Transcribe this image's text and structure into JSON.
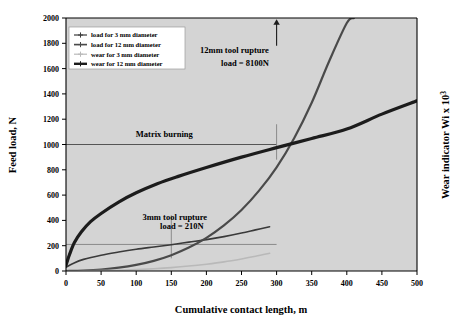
{
  "chart_data": {
    "type": "line",
    "title": "",
    "xlabel": "Cumulative contact length, m",
    "ylabel": "Feed load, N",
    "y2label": "Wear indicator Wi x 10³",
    "xlim": [
      0,
      500
    ],
    "ylim": [
      0,
      2000
    ],
    "xticks": [
      0,
      50,
      100,
      150,
      200,
      250,
      300,
      350,
      400,
      450,
      500
    ],
    "yticks": [
      0,
      200,
      400,
      600,
      800,
      1000,
      1200,
      1400,
      1600,
      1800,
      2000
    ],
    "y2ticks": [],
    "grid": false,
    "legend_position": "top-left",
    "plot_background": "#d4d4d4",
    "series": [
      {
        "name": "load for 3 mm diameter",
        "color": "#3a3a3a",
        "width": 1.6,
        "marker": "cross",
        "x": [
          0,
          10,
          25,
          50,
          75,
          100,
          125,
          150,
          175,
          200,
          225,
          250,
          270,
          290
        ],
        "y": [
          30,
          60,
          92,
          125,
          150,
          172,
          190,
          208,
          228,
          248,
          272,
          300,
          325,
          350
        ]
      },
      {
        "name": "load for 12 mm diameter",
        "color": "#4a4a4a",
        "width": 2.2,
        "marker": "cross",
        "x": [
          0,
          25,
          50,
          75,
          100,
          125,
          150,
          175,
          200,
          225,
          250,
          275,
          300,
          325,
          350,
          375,
          400,
          410
        ],
        "y": [
          0,
          4,
          12,
          26,
          48,
          80,
          125,
          185,
          262,
          360,
          482,
          635,
          820,
          1050,
          1330,
          1660,
          1960,
          2000
        ]
      },
      {
        "name": "wear for 3 mm diameter",
        "color": "#b9b9b9",
        "width": 1.6,
        "marker": "cross",
        "x": [
          0,
          25,
          50,
          75,
          100,
          125,
          150,
          175,
          200,
          225,
          250,
          270,
          290
        ],
        "y": [
          0,
          1,
          3,
          6,
          11,
          18,
          27,
          39,
          54,
          72,
          95,
          116,
          140
        ]
      },
      {
        "name": "wear for 12 mm diameter",
        "color": "#1c1c1c",
        "width": 3.2,
        "marker": "cross",
        "x": [
          0,
          5,
          12,
          22,
          35,
          50,
          75,
          100,
          130,
          160,
          200,
          250,
          300,
          350,
          400,
          450,
          500
        ],
        "y": [
          45,
          130,
          225,
          310,
          390,
          455,
          545,
          618,
          690,
          748,
          818,
          900,
          975,
          1048,
          1122,
          1240,
          1345
        ]
      }
    ],
    "annotations": [
      {
        "id": "matrix-burning",
        "text": "Matrix burning",
        "x": 140,
        "y": 1060,
        "type": "label"
      },
      {
        "id": "matrix-burning-line",
        "type": "hline",
        "y": 1000,
        "x_start": 0,
        "x_end": 300,
        "color": "#555555"
      },
      {
        "id": "rupture-3mm-line",
        "type": "hline",
        "y": 210,
        "x_start": 0,
        "x_end": 300,
        "color": "#8a8a8a"
      },
      {
        "id": "rupture-3mm-vline",
        "type": "vline",
        "x": 150,
        "y_start": 100,
        "y_end": 440,
        "color": "#8a8a8a"
      },
      {
        "id": "rupture-12mm-vline",
        "type": "vline",
        "x": 300,
        "y_start": 880,
        "y_end": 1160,
        "color": "#8a8a8a"
      },
      {
        "id": "rupture-3mm-label-1",
        "text": "3mm tool rupture",
        "x": 155,
        "y": 400,
        "type": "label"
      },
      {
        "id": "rupture-3mm-label-2",
        "text": "load = 210N",
        "x": 165,
        "y": 330,
        "type": "label"
      },
      {
        "id": "rupture-12mm-label-1",
        "text": "12mm tool rupture",
        "x": 240,
        "y": 1720,
        "type": "label"
      },
      {
        "id": "rupture-12mm-label-2",
        "text": "load = 8100N",
        "x": 255,
        "y": 1620,
        "type": "label"
      },
      {
        "id": "rupture-12mm-arrow",
        "type": "arrow-up",
        "x": 300,
        "y_start": 1780,
        "y_end": 1990,
        "color": "#1c1c1c"
      }
    ]
  },
  "legend": {
    "items": [
      {
        "label": "load for 3 mm diameter"
      },
      {
        "label": "load for 12 mm diameter"
      },
      {
        "label": "wear for 3 mm diameter"
      },
      {
        "label": "wear for 12 mm diameter"
      }
    ]
  },
  "axes": {
    "x_title": "Cumulative contact length, m",
    "y_left_title": "Feed load, N",
    "y_right_title_main": "Wear indicator Wi x 10",
    "y_right_title_sup": "3"
  }
}
